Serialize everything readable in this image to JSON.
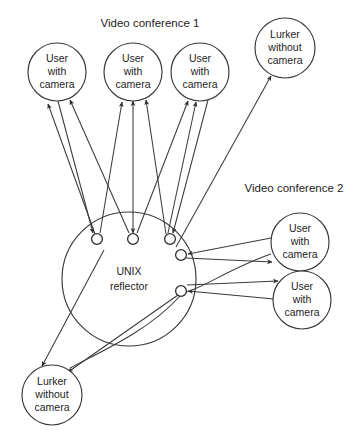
{
  "diagram": {
    "title_visible": false,
    "background_color": "#ffffff",
    "stroke_color": "#3a3a3a",
    "text_color": "#1d1d1d",
    "groups": [
      {
        "id": "vc1",
        "label": "Video conference 1",
        "x": 150,
        "y": 24
      },
      {
        "id": "vc2",
        "label": "Video conference 2",
        "x": 294,
        "y": 189
      }
    ],
    "hub": {
      "id": "reflector",
      "label_line1": "UNIX",
      "label_line2": "reflector",
      "cx": 129,
      "cy": 279,
      "r": 67,
      "label_x": 129,
      "label_y": 279
    },
    "ports": [
      {
        "id": "port-top-1",
        "cx": 97,
        "cy": 239,
        "r": 5.4
      },
      {
        "id": "port-top-2",
        "cx": 133,
        "cy": 239,
        "r": 5.4
      },
      {
        "id": "port-top-3",
        "cx": 170,
        "cy": 239,
        "r": 5.4
      },
      {
        "id": "port-right-1",
        "cx": 181,
        "cy": 255,
        "r": 5.4
      },
      {
        "id": "port-right-2",
        "cx": 181,
        "cy": 291,
        "r": 5.4
      }
    ],
    "nodes": [
      {
        "id": "user-1",
        "kind": "user-with-camera",
        "lines": [
          "User",
          "with",
          "camera"
        ],
        "cx": 57,
        "cy": 72,
        "r": 29
      },
      {
        "id": "user-2",
        "kind": "user-with-camera",
        "lines": [
          "User",
          "with",
          "camera"
        ],
        "cx": 133,
        "cy": 72,
        "r": 29
      },
      {
        "id": "user-3",
        "kind": "user-with-camera",
        "lines": [
          "User",
          "with",
          "camera"
        ],
        "cx": 200,
        "cy": 72,
        "r": 29
      },
      {
        "id": "lurker-top",
        "kind": "lurker-without-camera",
        "lines": [
          "Lurker",
          "without",
          "camera"
        ],
        "cx": 285,
        "cy": 48,
        "r": 30
      },
      {
        "id": "user-4",
        "kind": "user-with-camera",
        "lines": [
          "User",
          "with",
          "camera"
        ],
        "cx": 300,
        "cy": 242,
        "r": 29
      },
      {
        "id": "user-5",
        "kind": "user-with-camera",
        "lines": [
          "User",
          "with",
          "camera"
        ],
        "cx": 302,
        "cy": 300,
        "r": 29
      },
      {
        "id": "lurker-bottom",
        "kind": "lurker-without-camera",
        "lines": [
          "Lurker",
          "without",
          "camera"
        ],
        "cx": 52,
        "cy": 395,
        "r": 30
      }
    ],
    "edges": [
      {
        "id": "e-p1-u1-out",
        "from": "port-top-1",
        "to": "user-1",
        "x1": 95,
        "y1": 234,
        "x2": 48,
        "y2": 104,
        "arrow": "end"
      },
      {
        "id": "e-u1-p1-in",
        "from": "user-1",
        "to": "port-top-1",
        "x1": 58,
        "y1": 101,
        "x2": 93,
        "y2": 233,
        "arrow": "end"
      },
      {
        "id": "e-p1-u2-out",
        "from": "port-top-1",
        "to": "user-2",
        "x1": 100,
        "y1": 233,
        "x2": 122,
        "y2": 102,
        "arrow": "end"
      },
      {
        "id": "e-p2-u2-bi",
        "from": "port-top-2",
        "to": "user-2",
        "x1": 133,
        "y1": 233,
        "x2": 133,
        "y2": 101,
        "arrow": "both"
      },
      {
        "id": "e-p2-u1-out",
        "from": "port-top-2",
        "to": "user-1",
        "x1": 129,
        "y1": 233,
        "x2": 70,
        "y2": 100,
        "arrow": "end"
      },
      {
        "id": "e-p2-u3-out",
        "from": "port-top-2",
        "to": "user-3",
        "x1": 137,
        "y1": 233,
        "x2": 188,
        "y2": 101,
        "arrow": "end"
      },
      {
        "id": "e-p3-u3-out",
        "from": "port-top-3",
        "to": "user-3",
        "x1": 168,
        "y1": 233,
        "x2": 196,
        "y2": 102,
        "arrow": "end"
      },
      {
        "id": "e-u3-p3-in",
        "from": "user-3",
        "to": "port-top-3",
        "x1": 208,
        "y1": 100,
        "x2": 173,
        "y2": 233,
        "arrow": "end"
      },
      {
        "id": "e-p3-u2-out",
        "from": "port-top-3",
        "to": "user-2",
        "x1": 166,
        "y1": 234,
        "x2": 146,
        "y2": 100,
        "arrow": "end"
      },
      {
        "id": "e-hub-lurkertop",
        "from": "reflector",
        "to": "lurker-top",
        "x1": 176,
        "y1": 247,
        "x2": 271,
        "y2": 76,
        "arrow": "end"
      },
      {
        "id": "e-u4-hub-in",
        "from": "user-4",
        "to": "port-right-1",
        "x1": 271,
        "y1": 238,
        "x2": 188,
        "y2": 254,
        "arrow": "end"
      },
      {
        "id": "e-hub-u4-out",
        "from": "port-right-1",
        "to": "user-4",
        "x1": 186,
        "y1": 258,
        "x2": 272,
        "y2": 262,
        "arrow": "end"
      },
      {
        "id": "e-hub-u5-out",
        "from": "port-right-2",
        "to": "user-5",
        "x1": 187,
        "y1": 285,
        "x2": 278,
        "y2": 281,
        "arrow": "end"
      },
      {
        "id": "e-u5-hub-in",
        "from": "user-5",
        "to": "port-right-2",
        "x1": 274,
        "y1": 299,
        "x2": 188,
        "y2": 291,
        "arrow": "end"
      },
      {
        "id": "e-hub-lurkerbottom-1",
        "from": "reflector",
        "to": "lurker-bottom",
        "x1": 104,
        "y1": 250,
        "x2": 42,
        "y2": 366,
        "arrow": "end"
      },
      {
        "id": "e-hub-lurkerbottom-2",
        "from": "port-right-2",
        "to": "lurker-bottom",
        "x1": 178,
        "y1": 295,
        "x2": 68,
        "y2": 372,
        "arrow": "end"
      }
    ],
    "curves": [
      {
        "id": "curve-u4-hub",
        "d": "M 271 254 C 230 268 200 290 183 293"
      },
      {
        "id": "curve-hub-lurkerbottom",
        "d": "M 180 296 C 150 330 100 352 70 368"
      }
    ],
    "icons": {
      "arrowhead": "arrowhead-icon"
    }
  }
}
